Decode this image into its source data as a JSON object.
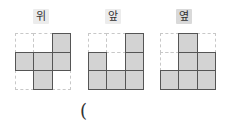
{
  "views": [
    {
      "label": "위",
      "highlight": false,
      "grid": [
        [
          0,
          0,
          1
        ],
        [
          1,
          1,
          1
        ],
        [
          0,
          1,
          0
        ]
      ]
    },
    {
      "label": "앞",
      "highlight": false,
      "grid": [
        [
          0,
          0,
          1
        ],
        [
          1,
          0,
          1
        ],
        [
          1,
          1,
          1
        ]
      ]
    },
    {
      "label": "옆",
      "highlight": true,
      "grid": [
        [
          0,
          1,
          0
        ],
        [
          0,
          1,
          1
        ],
        [
          1,
          1,
          1
        ]
      ]
    }
  ],
  "answer_prefix": "("
}
